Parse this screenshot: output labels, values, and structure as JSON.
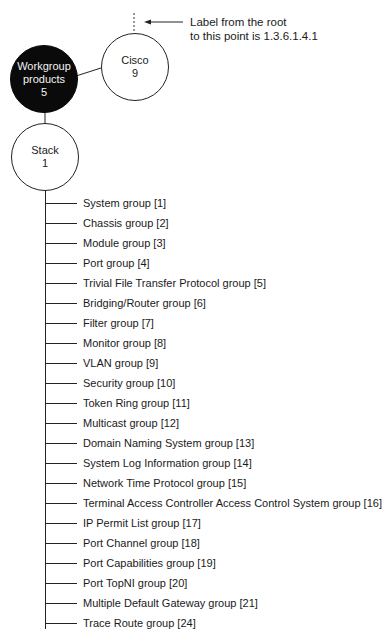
{
  "annotation": {
    "line1": "Label from the root",
    "line2": "to this point is 1.3.6.1.4.1"
  },
  "nodes": {
    "cisco": {
      "name": "Cisco",
      "number": "9",
      "fill": "#ffffff"
    },
    "workgroup": {
      "name_line1": "Workgroup",
      "name_line2": "products",
      "number": "5",
      "fill": "#0a0a0a"
    },
    "stack": {
      "name": "Stack",
      "number": "1",
      "fill": "#ffffff"
    }
  },
  "groups": [
    "System group [1]",
    "Chassis group [2]",
    "Module group [3]",
    "Port group [4]",
    "Trivial File Transfer Protocol group [5]",
    "Bridging/Router group [6]",
    "Filter group [7]",
    "Monitor group [8]",
    "VLAN group [9]",
    "Security group [10]",
    "Token Ring group [11]",
    "Multicast group [12]",
    "Domain Naming System group [13]",
    "System Log Information group [14]",
    "Network Time Protocol group [15]",
    "Terminal Access Controller Access Control System group [16]",
    "IP Permit List group [17]",
    "Port Channel group [18]",
    "Port Capabilities group [19]",
    "Port TopNI group [20]",
    "Multiple Default Gateway group [21]",
    "Trace Route group [24]"
  ]
}
